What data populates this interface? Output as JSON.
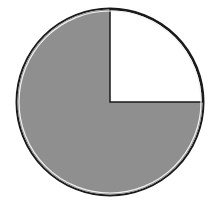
{
  "chart_data": {
    "type": "pie",
    "title": "",
    "categories": [
      "Shaded",
      "Unshaded"
    ],
    "values": [
      75,
      25
    ],
    "unit": "percent",
    "colors": [
      "#8f8f8f",
      "#ffffff"
    ],
    "start_angle_deg": 0,
    "direction": "clockwise-from-12-oclock for unshaded slice (12 to 3 o'clock)",
    "legend": "none",
    "outline_color": "#1a1a1a"
  },
  "colors": {
    "background": "#ffffff",
    "shaded": "#8f8f8f",
    "unshaded": "#ffffff",
    "outline": "#1a1a1a"
  }
}
